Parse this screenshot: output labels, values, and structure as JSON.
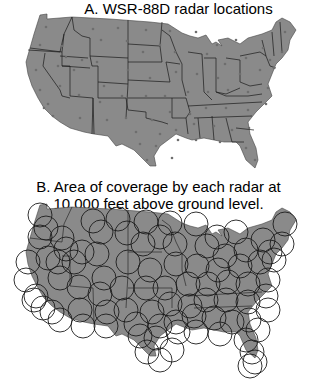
{
  "panel_a": {
    "title": "A. WSR-88D radar locations"
  },
  "panel_b": {
    "title_line1": "B. Area of coverage by each radar at",
    "title_line2": "10,000 feet above ground level."
  },
  "colors": {
    "land": "#8a8a8a",
    "border": "#1a1a1a",
    "radar_dot": "#6e6e6e",
    "coverage_circle": "#1c1c1c",
    "background": "#ffffff"
  },
  "radar_sites_panel_a": [
    [
      46,
      27
    ],
    [
      93,
      29
    ],
    [
      118,
      28
    ],
    [
      146,
      30
    ],
    [
      170,
      31
    ],
    [
      196,
      32
    ],
    [
      217,
      45
    ],
    [
      236,
      40
    ],
    [
      263,
      48
    ],
    [
      285,
      32
    ],
    [
      40,
      45
    ],
    [
      62,
      46
    ],
    [
      66,
      57
    ],
    [
      82,
      60
    ],
    [
      101,
      40
    ],
    [
      127,
      41
    ],
    [
      143,
      52
    ],
    [
      160,
      45
    ],
    [
      175,
      52
    ],
    [
      207,
      54
    ],
    [
      225,
      64
    ],
    [
      246,
      58
    ],
    [
      270,
      60
    ],
    [
      282,
      52
    ],
    [
      36,
      70
    ],
    [
      58,
      66
    ],
    [
      74,
      70
    ],
    [
      97,
      62
    ],
    [
      104,
      86
    ],
    [
      128,
      70
    ],
    [
      150,
      78
    ],
    [
      176,
      72
    ],
    [
      197,
      74
    ],
    [
      218,
      78
    ],
    [
      240,
      74
    ],
    [
      260,
      70
    ],
    [
      274,
      68
    ],
    [
      40,
      90
    ],
    [
      48,
      104
    ],
    [
      60,
      86
    ],
    [
      79,
      95
    ],
    [
      100,
      102
    ],
    [
      122,
      96
    ],
    [
      146,
      96
    ],
    [
      165,
      96
    ],
    [
      188,
      92
    ],
    [
      208,
      92
    ],
    [
      228,
      90
    ],
    [
      248,
      92
    ],
    [
      268,
      88
    ],
    [
      44,
      108
    ],
    [
      53,
      116
    ],
    [
      80,
      118
    ],
    [
      107,
      120
    ],
    [
      126,
      118
    ],
    [
      152,
      120
    ],
    [
      170,
      112
    ],
    [
      190,
      114
    ],
    [
      206,
      108
    ],
    [
      226,
      108
    ],
    [
      248,
      110
    ],
    [
      266,
      104
    ],
    [
      136,
      132
    ],
    [
      160,
      134
    ],
    [
      176,
      130
    ],
    [
      194,
      124
    ],
    [
      214,
      126
    ],
    [
      232,
      130
    ],
    [
      249,
      128
    ],
    [
      140,
      144
    ],
    [
      156,
      146
    ],
    [
      178,
      140
    ],
    [
      196,
      140
    ],
    [
      220,
      142
    ],
    [
      246,
      148
    ],
    [
      147,
      160
    ],
    [
      172,
      158
    ],
    [
      255,
      160
    ]
  ],
  "radar_sites_panel_b": [
    [
      40,
      215
    ],
    [
      46,
      228
    ],
    [
      93,
      221
    ],
    [
      118,
      219
    ],
    [
      146,
      222
    ],
    [
      170,
      223
    ],
    [
      196,
      224
    ],
    [
      217,
      237
    ],
    [
      236,
      232
    ],
    [
      263,
      240
    ],
    [
      285,
      224
    ],
    [
      40,
      237
    ],
    [
      62,
      238
    ],
    [
      66,
      249
    ],
    [
      82,
      252
    ],
    [
      101,
      232
    ],
    [
      127,
      233
    ],
    [
      143,
      244
    ],
    [
      160,
      237
    ],
    [
      175,
      244
    ],
    [
      207,
      246
    ],
    [
      225,
      256
    ],
    [
      246,
      250
    ],
    [
      270,
      252
    ],
    [
      282,
      244
    ],
    [
      28,
      262
    ],
    [
      48,
      258
    ],
    [
      58,
      262
    ],
    [
      74,
      262
    ],
    [
      97,
      254
    ],
    [
      104,
      278
    ],
    [
      128,
      262
    ],
    [
      150,
      270
    ],
    [
      176,
      264
    ],
    [
      197,
      266
    ],
    [
      218,
      270
    ],
    [
      240,
      266
    ],
    [
      260,
      262
    ],
    [
      274,
      260
    ],
    [
      26,
      280
    ],
    [
      36,
      296
    ],
    [
      60,
      278
    ],
    [
      79,
      287
    ],
    [
      100,
      294
    ],
    [
      122,
      288
    ],
    [
      146,
      288
    ],
    [
      165,
      288
    ],
    [
      188,
      284
    ],
    [
      208,
      284
    ],
    [
      228,
      282
    ],
    [
      248,
      284
    ],
    [
      268,
      280
    ],
    [
      34,
      300
    ],
    [
      43,
      308
    ],
    [
      52,
      312
    ],
    [
      80,
      310
    ],
    [
      107,
      312
    ],
    [
      126,
      310
    ],
    [
      152,
      312
    ],
    [
      170,
      304
    ],
    [
      190,
      306
    ],
    [
      206,
      300
    ],
    [
      226,
      300
    ],
    [
      248,
      302
    ],
    [
      266,
      296
    ],
    [
      60,
      320
    ],
    [
      83,
      326
    ],
    [
      106,
      326
    ],
    [
      136,
      324
    ],
    [
      160,
      326
    ],
    [
      176,
      322
    ],
    [
      194,
      316
    ],
    [
      214,
      318
    ],
    [
      232,
      322
    ],
    [
      249,
      320
    ],
    [
      268,
      310
    ],
    [
      140,
      336
    ],
    [
      156,
      338
    ],
    [
      178,
      332
    ],
    [
      196,
      332
    ],
    [
      220,
      334
    ],
    [
      246,
      340
    ],
    [
      258,
      330
    ],
    [
      147,
      352
    ],
    [
      160,
      360
    ],
    [
      172,
      350
    ],
    [
      252,
      352
    ],
    [
      255,
      362
    ],
    [
      250,
      366
    ]
  ],
  "coverage_radius_px": 12
}
